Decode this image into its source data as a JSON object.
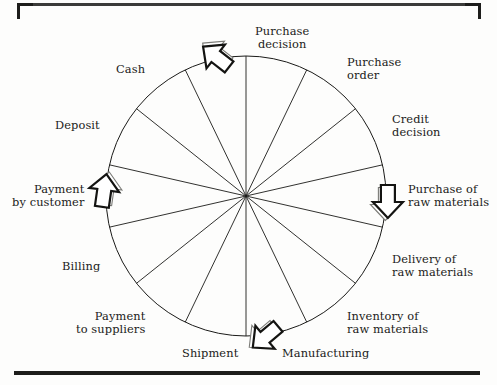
{
  "figure": {
    "type": "cycle-wheel-diagram",
    "segment_count": 14,
    "line_color": "#1b1b19",
    "background_color": "#fdfdfc",
    "center": {
      "x": 246,
      "y": 196
    },
    "radius": 140
  },
  "segments": [
    {
      "id": "purchase-decision",
      "label": "Purchase\ndecision",
      "angle_deg": 0,
      "align": "c"
    },
    {
      "id": "purchase-order",
      "label": "Purchase\norder",
      "angle_deg": 25.7,
      "align": "l"
    },
    {
      "id": "credit-decision",
      "label": "Credit\ndecision",
      "angle_deg": 51.4,
      "align": "l"
    },
    {
      "id": "purchase-of-raw-materials",
      "label": "Purchase of\nraw materials",
      "angle_deg": 77.1,
      "align": "l"
    },
    {
      "id": "delivery-of-raw-materials",
      "label": "Delivery of\nraw materials",
      "angle_deg": 102.9,
      "align": "l"
    },
    {
      "id": "inventory-of-raw-materials",
      "label": "Inventory of\nraw materials",
      "angle_deg": 128.6,
      "align": "l"
    },
    {
      "id": "manufacturing",
      "label": "Manufacturing",
      "angle_deg": 154.3,
      "align": "l"
    },
    {
      "id": "shipment",
      "label": "Shipment",
      "angle_deg": 180,
      "align": "c"
    },
    {
      "id": "payment-to-suppliers",
      "label": "Payment\nto suppliers",
      "angle_deg": 205.7,
      "align": "r"
    },
    {
      "id": "billing",
      "label": "Billing",
      "angle_deg": 231.4,
      "align": "r"
    },
    {
      "id": "payment-by-customer",
      "label": "Payment\nby customer",
      "angle_deg": 257.1,
      "align": "r"
    },
    {
      "id": "deposit",
      "label": "Deposit",
      "angle_deg": 282.9,
      "align": "r"
    },
    {
      "id": "cash",
      "label": "Cash",
      "angle_deg": 308.6,
      "align": "r"
    },
    {
      "id": "blank-top-left",
      "label": "",
      "angle_deg": 334.3,
      "align": "r"
    }
  ],
  "arrows": [
    {
      "id": "arrow-top",
      "position": "top",
      "points": "upper-left",
      "near_label": "Purchase decision"
    },
    {
      "id": "arrow-right",
      "position": "right",
      "points": "down",
      "near_label": "Purchase of raw materials"
    },
    {
      "id": "arrow-bottom",
      "position": "bottom",
      "points": "lower-left",
      "near_label": "Manufacturing"
    },
    {
      "id": "arrow-left",
      "position": "left",
      "points": "up",
      "near_label": "Payment by customer"
    }
  ]
}
